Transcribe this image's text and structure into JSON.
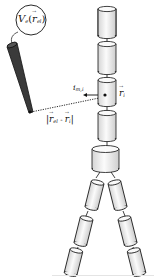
{
  "figure": {
    "labels": {
      "potential_prefix": "V",
      "potential_sub": "e",
      "potential_arg_open": "(",
      "potential_arg_var": "r",
      "potential_arg_sub": "el",
      "potential_arg_close": ")",
      "current_var": "i",
      "current_sub": "m,i",
      "position_var": "r",
      "position_sub": "i",
      "distance_bar_left": "|",
      "distance_var1": "r",
      "distance_sub1": "el",
      "distance_minus": " - ",
      "distance_var2": "r",
      "distance_sub2": "i",
      "distance_bar_right": "|"
    },
    "colors": {
      "electrode": "#3a3a3a",
      "outline": "#1a1a1a",
      "cylinder_fill": "#f4f4f4",
      "cylinder_shade": "#d8d8d8"
    },
    "compartments": {
      "spine_count": 4,
      "torso_count": 1,
      "leg_segments_per_side": 3
    }
  }
}
